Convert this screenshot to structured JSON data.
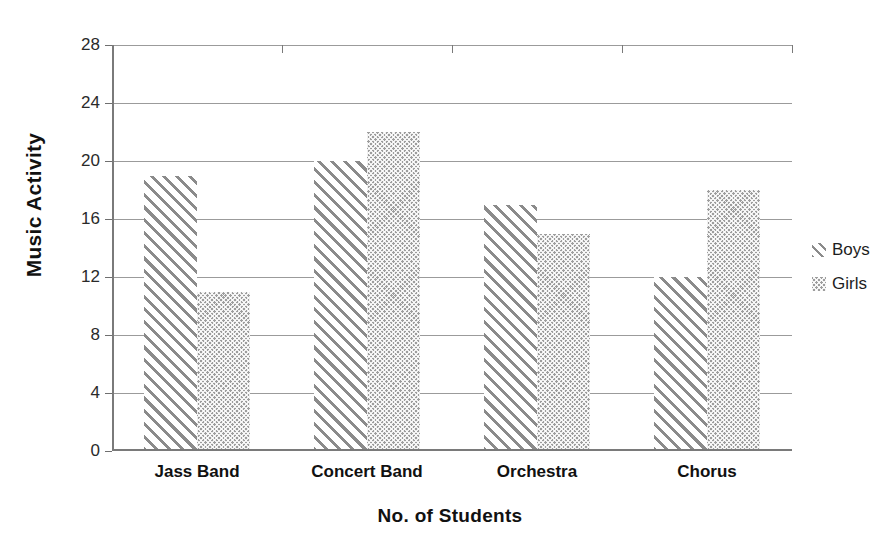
{
  "chart_data": {
    "type": "bar",
    "title": "",
    "xlabel": "No. of Students",
    "ylabel": "Music Activity",
    "categories": [
      "Jass Band",
      "Concert Band",
      "Orchestra",
      "Chorus"
    ],
    "series": [
      {
        "name": "Boys",
        "values": [
          19,
          20,
          17,
          12
        ],
        "pattern": "diagonal-hatch",
        "color": "#8b8b8b"
      },
      {
        "name": "Girls",
        "values": [
          11,
          22,
          15,
          18
        ],
        "pattern": "checker-dots",
        "color": "#9d9d9d"
      }
    ],
    "ylim": [
      0,
      28
    ],
    "ytick_labels": [
      "0",
      "4",
      "8",
      "12",
      "16",
      "20",
      "24",
      "28"
    ],
    "ytick_values": [
      0,
      4,
      8,
      12,
      16,
      20,
      24,
      28
    ],
    "grid": true,
    "legend_position": "right"
  },
  "legend": {
    "items": [
      {
        "label": "Boys",
        "icon": "diagonal-hatch-swatch"
      },
      {
        "label": "Girls",
        "icon": "checker-dot-swatch"
      }
    ]
  },
  "axes": {
    "y_title": "Music Activity",
    "x_title": "No. of Students"
  }
}
